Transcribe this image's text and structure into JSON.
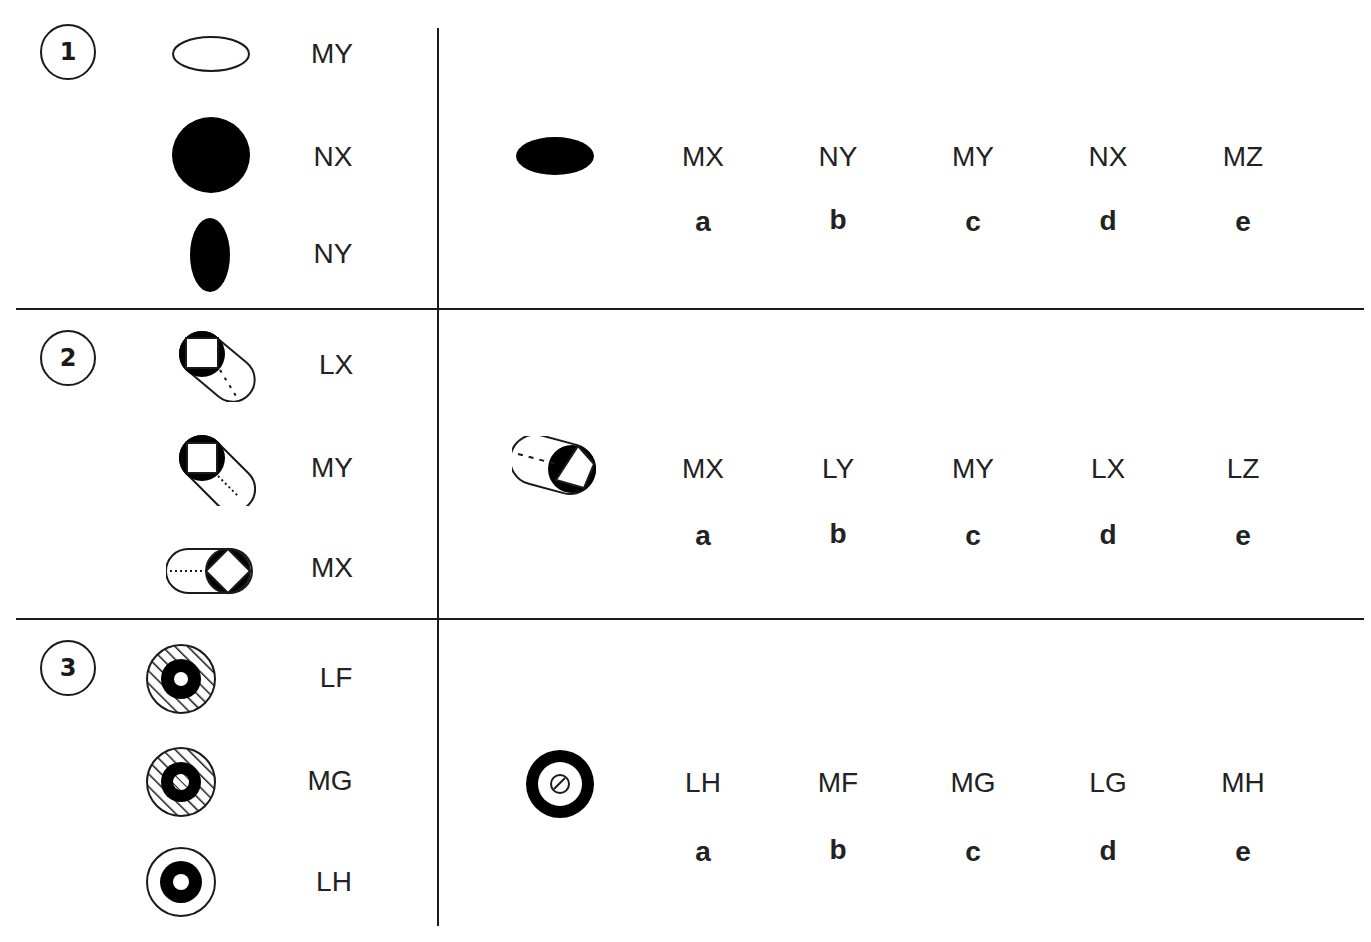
{
  "colors": {
    "line": "#1a1a1a",
    "text": "#222222",
    "background": "#ffffff"
  },
  "questions": [
    {
      "number": "1",
      "examples": [
        {
          "icon": "hollow-horizontal-ellipse",
          "label": "MY"
        },
        {
          "icon": "filled-circle",
          "label": "NX"
        },
        {
          "icon": "filled-vertical-ellipse",
          "label": "NY"
        }
      ],
      "target_icon": "filled-horizontal-ellipse",
      "options": [
        {
          "code": "MX",
          "letter": "a"
        },
        {
          "code": "NY",
          "letter": "b"
        },
        {
          "code": "MY",
          "letter": "c"
        },
        {
          "code": "NX",
          "letter": "d"
        },
        {
          "code": "MZ",
          "letter": "e"
        }
      ]
    },
    {
      "number": "2",
      "examples": [
        {
          "icon": "cylinder-square-diag-dashed",
          "label": "LX"
        },
        {
          "icon": "cylinder-square-diag-dotted",
          "label": "MY"
        },
        {
          "icon": "cylinder-diamond-horizontal",
          "label": "MX"
        }
      ],
      "target_icon": "cylinder-diamond-tilted-right",
      "options": [
        {
          "code": "MX",
          "letter": "a"
        },
        {
          "code": "LY",
          "letter": "b"
        },
        {
          "code": "MY",
          "letter": "c"
        },
        {
          "code": "LX",
          "letter": "d"
        },
        {
          "code": "LZ",
          "letter": "e"
        }
      ]
    },
    {
      "number": "3",
      "examples": [
        {
          "icon": "hatched-ring-hollow-core",
          "label": "LF"
        },
        {
          "icon": "hatched-ring-hatched-core",
          "label": "MG"
        },
        {
          "icon": "plain-ring-hollow-core",
          "label": "LH"
        }
      ],
      "target_icon": "thick-ring-hatched-center",
      "options": [
        {
          "code": "LH",
          "letter": "a"
        },
        {
          "code": "MF",
          "letter": "b"
        },
        {
          "code": "MG",
          "letter": "c"
        },
        {
          "code": "LG",
          "letter": "d"
        },
        {
          "code": "MH",
          "letter": "e"
        }
      ]
    }
  ]
}
